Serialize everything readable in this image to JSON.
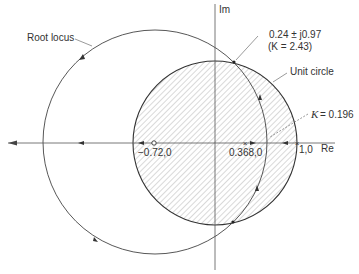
{
  "diagram": {
    "axes": {
      "real_label": "Re",
      "imag_label": "Im"
    },
    "labels": {
      "root_locus": "Root locus",
      "unit_circle": "Unit circle",
      "intersection_point": "0.24 ± j0.97",
      "intersection_gain": "(K = 2.43)",
      "k_breakaway_prefix": "K",
      "k_breakaway_value": "= 0.196",
      "zero_point": "−0.72,0",
      "pole_point": "0.368,0",
      "one_point": "1,0"
    },
    "colors": {
      "line": "#444444",
      "hatch": "#9a9a9a",
      "text": "#333333"
    }
  }
}
